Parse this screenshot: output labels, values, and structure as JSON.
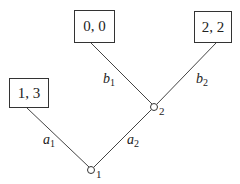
{
  "diagram": {
    "type": "game-tree",
    "nodes": [
      {
        "id": "1",
        "label": "1",
        "x": 91,
        "y": 170
      },
      {
        "id": "2",
        "label": "2",
        "x": 154,
        "y": 107
      }
    ],
    "terminals": [
      {
        "id": "t13",
        "payoff": "1, 3"
      },
      {
        "id": "t00",
        "payoff": "0, 0"
      },
      {
        "id": "t22",
        "payoff": "2, 2"
      }
    ],
    "edges": [
      {
        "from": "1",
        "to": "t13",
        "action": "a",
        "sub": "1"
      },
      {
        "from": "1",
        "to": "2",
        "action": "a",
        "sub": "2"
      },
      {
        "from": "2",
        "to": "t00",
        "action": "b",
        "sub": "1"
      },
      {
        "from": "2",
        "to": "t22",
        "action": "b",
        "sub": "2"
      }
    ]
  }
}
